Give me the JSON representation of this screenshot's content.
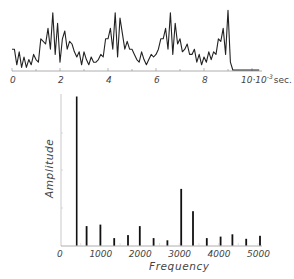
{
  "chart_data": [
    {
      "type": "line",
      "title": "",
      "xlabel": "10·10^-3 sec.",
      "ylabel": "",
      "x_ticks": [
        "0",
        "2",
        "4",
        "6",
        "8",
        "10·10⁻³ sec."
      ],
      "xlim": [
        0,
        10.5
      ],
      "description": "Time-domain waveform with quasi-periodic bursts (period ≈ 3.3·10⁻³ s)",
      "x": [
        0,
        0.1,
        0.2,
        0.3,
        0.4,
        0.5,
        0.6,
        0.7,
        0.8,
        0.9,
        1.0,
        1.1,
        1.2,
        1.3,
        1.4,
        1.5,
        1.6,
        1.7,
        1.8,
        1.9,
        2.0,
        2.1,
        2.2,
        2.3,
        2.4,
        2.5,
        2.6,
        2.7,
        2.8,
        2.9,
        3.0,
        3.1,
        3.2,
        3.3,
        3.4,
        3.5,
        3.6,
        3.7,
        3.8,
        3.9,
        4.0,
        4.1,
        4.2,
        4.3,
        4.4,
        4.5,
        4.6,
        4.7,
        4.8,
        4.9,
        5.0,
        5.1,
        5.2,
        5.3,
        5.4,
        5.5,
        5.6,
        5.7,
        5.8,
        5.9,
        6.0,
        6.1,
        6.2,
        6.3,
        6.4,
        6.5,
        6.6,
        6.7,
        6.8,
        6.9,
        7.0,
        7.1,
        7.2,
        7.3,
        7.4,
        7.5,
        7.6,
        7.7,
        7.8,
        7.9,
        8.0,
        8.1,
        8.2,
        8.3,
        8.4,
        8.5,
        8.6,
        8.7,
        8.8,
        8.9,
        9.0,
        9.1,
        9.2,
        9.3,
        9.4,
        9.5,
        9.6,
        9.7,
        9.8,
        9.9,
        10.0,
        10.1,
        10.2,
        10.3
      ],
      "values": [
        4,
        4,
        1,
        3.5,
        0.5,
        2.5,
        0.5,
        2,
        1,
        3,
        2,
        1.5,
        6,
        5.5,
        5,
        8,
        4,
        11,
        3,
        9,
        1.5,
        6,
        7.5,
        4,
        5.5,
        5,
        3.5,
        2.5,
        3.5,
        1,
        3.5,
        2,
        1,
        2.5,
        1.5,
        1.5,
        2,
        3,
        2.5,
        6,
        6,
        8,
        4,
        11,
        2.5,
        10,
        7,
        4,
        5.5,
        4,
        4,
        3,
        2,
        1.5,
        3.5,
        2,
        1,
        2,
        3,
        2.5,
        3,
        4,
        6,
        6,
        8,
        4,
        11,
        3,
        9,
        5,
        6,
        3.5,
        4,
        5,
        3,
        3,
        4,
        1.5,
        3,
        1,
        2.5,
        1.5,
        3.5,
        2,
        3.5,
        3,
        6,
        5.5,
        8,
        3,
        11.5,
        1.5
      ]
    },
    {
      "type": "bar",
      "title": "",
      "xlabel": "Frequency",
      "ylabel": "Amplitude",
      "x_ticks": [
        "0",
        "1000",
        "2000",
        "3000",
        "4000",
        "5000"
      ],
      "xlim": [
        0,
        5200
      ],
      "ylim": [
        0,
        100
      ],
      "grid": false,
      "categories": [
        400,
        650,
        1000,
        1350,
        1700,
        2000,
        2350,
        2700,
        3050,
        3350,
        3700,
        4050,
        4350,
        4700,
        5050
      ],
      "values": [
        100,
        13,
        14,
        5,
        7,
        13,
        5,
        3.5,
        38,
        23,
        5,
        6,
        7.5,
        4.5,
        6.5
      ]
    }
  ],
  "labels": {
    "top_x_unit": "10·10",
    "top_x_exp": "-3",
    "top_x_suffix": "sec.",
    "bottom_xlabel": "Frequency",
    "bottom_ylabel": "Amplitude"
  }
}
